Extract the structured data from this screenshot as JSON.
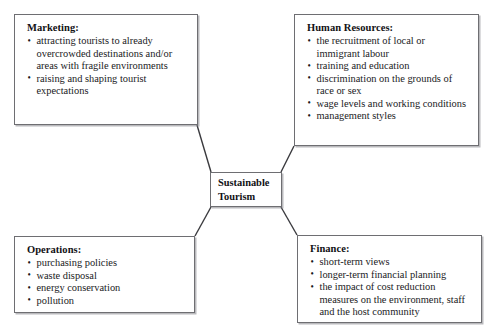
{
  "diagram": {
    "type": "spoke-diagram",
    "center": {
      "label_lines": [
        "Sustainable",
        "Tourism"
      ],
      "line1": "Sustainable",
      "line2": "Tourism"
    },
    "colors": {
      "background": "#ffffff",
      "box_border": "#6e6e72",
      "box_shadow": "#828287",
      "connector_line": "#3a3a3e",
      "text": "#1a1a1d"
    },
    "nodes": [
      {
        "id": "marketing",
        "title": "Marketing:",
        "items": [
          "attracting tourists to already overcrowded destinations and/or areas with fragile environments",
          "raising and shaping tourist expectations"
        ]
      },
      {
        "id": "human-resources",
        "title": "Human Resources:",
        "items": [
          "the recruitment of local or immigrant labour",
          "training and education",
          "discrimination on the grounds of race or sex",
          "wage levels and working conditions",
          "management styles"
        ]
      },
      {
        "id": "operations",
        "title": "Operations:",
        "items": [
          "purchasing policies",
          "waste disposal",
          "energy conservation",
          "pollution"
        ]
      },
      {
        "id": "finance",
        "title": "Finance:",
        "items": [
          "short-term views",
          "longer-term financial planning",
          "the impact of cost reduction measures on the environment, staff and the host community"
        ]
      }
    ],
    "connectors": [
      {
        "from": "marketing",
        "to": "center",
        "x1": 197,
        "y1": 125,
        "x2": 211,
        "y2": 172
      },
      {
        "from": "human-resources",
        "to": "center",
        "x1": 294,
        "y1": 146,
        "x2": 281,
        "y2": 172
      },
      {
        "from": "operations",
        "to": "center",
        "x1": 195,
        "y1": 236,
        "x2": 211,
        "y2": 207
      },
      {
        "from": "finance",
        "to": "center",
        "x1": 297,
        "y1": 235,
        "x2": 281,
        "y2": 207
      }
    ]
  }
}
